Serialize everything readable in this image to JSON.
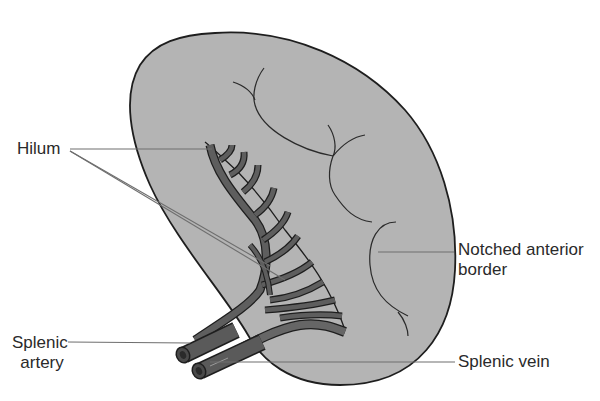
{
  "diagram": {
    "colors": {
      "organ_fill": "#b4b4b4",
      "outline": "#1e1e1e",
      "vessel_fill": "#5e5e5e",
      "vessel_light": "#787878",
      "leader_line": "#6e6e6e",
      "text": "#2a2a2a"
    },
    "labels": {
      "hilum": "Hilum",
      "notched_border_line1": "Notched anterior",
      "notched_border_line2": "border",
      "splenic_artery_line1": "Splenic",
      "splenic_artery_line2": "artery",
      "splenic_vein": "Splenic vein"
    }
  }
}
